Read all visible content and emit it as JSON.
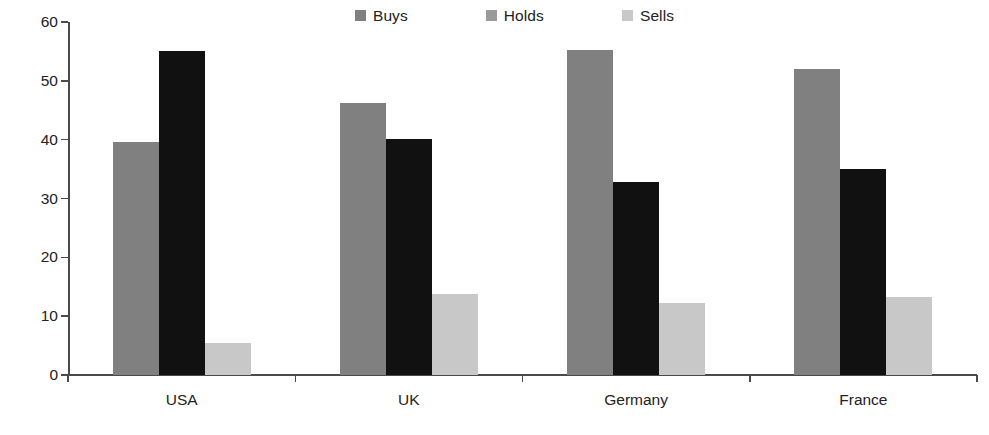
{
  "chart_data": {
    "type": "bar",
    "title": "",
    "subtitle": "",
    "xlabel": "",
    "ylabel": "",
    "categories": [
      "USA",
      "UK",
      "Germany",
      "France"
    ],
    "series": [
      {
        "name": "Buys",
        "color": "#808080",
        "values": [
          39.6,
          46.3,
          55.3,
          52.0
        ]
      },
      {
        "name": "Holds",
        "color": "#111111",
        "values": [
          55.0,
          40.1,
          32.8,
          35.0
        ]
      },
      {
        "name": "Sells",
        "color": "#c8c8c8",
        "values": [
          5.5,
          13.7,
          12.3,
          13.3
        ]
      }
    ],
    "ylim": [
      0,
      60
    ],
    "yticks": [
      0,
      10,
      20,
      30,
      40,
      50,
      60
    ],
    "ytick_labels": [
      "0",
      "10",
      "20",
      "30",
      "40",
      "50",
      "60"
    ],
    "grid": false,
    "legend_position": "top-center",
    "orientation": "vertical",
    "grouping": "clustered"
  },
  "axis": {
    "y_labels": [
      "60",
      "50",
      "40",
      "30",
      "20",
      "10",
      "0"
    ],
    "x_labels": [
      "USA",
      "UK",
      "Germany",
      "France"
    ]
  },
  "legend": {
    "items": [
      {
        "label": "Buys",
        "swatch": "legend-swatch-buys"
      },
      {
        "label": "Holds",
        "swatch": "legend-swatch-holds"
      },
      {
        "label": "Sells",
        "swatch": "legend-swatch-sells"
      }
    ]
  },
  "colors": {
    "buys": "#808080",
    "holds": "#111111",
    "sells": "#c8c8c8",
    "axis": "#4a4a4a",
    "text": "#222222",
    "background": "#ffffff"
  }
}
